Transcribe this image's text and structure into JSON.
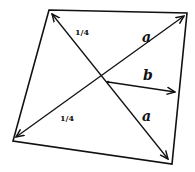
{
  "diagram": {
    "colors": {
      "stroke": "#111111",
      "background": "#ffffff"
    },
    "quadrilateral": {
      "corners": [
        [
          49,
          10
        ],
        [
          187,
          13
        ],
        [
          172,
          164
        ],
        [
          13,
          141
        ]
      ]
    },
    "center": [
      108,
      82
    ],
    "arrows": [
      {
        "name": "to-top-left",
        "tip": [
          52,
          14
        ]
      },
      {
        "name": "to-top-right",
        "tip": [
          184,
          16
        ]
      },
      {
        "name": "to-bottom-left",
        "tip": [
          16,
          137
        ]
      },
      {
        "name": "to-bottom-right",
        "tip": [
          168,
          159
        ]
      },
      {
        "name": "vector-b",
        "tip": [
          175,
          92
        ]
      }
    ],
    "labels": {
      "upper_left": "1/4",
      "lower_left": "1/4",
      "upper_right": "a",
      "lower_right": "a",
      "vector": "b"
    }
  }
}
